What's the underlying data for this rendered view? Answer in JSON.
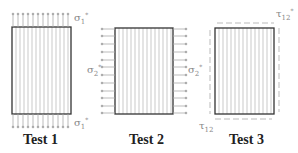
{
  "figure": {
    "tests": [
      {
        "label": "Test 1",
        "load": "σ1*",
        "load_symbol": "σ",
        "load_sub": "1",
        "load_sup": "*",
        "direction": "longitudinal tension (top & bottom edges)"
      },
      {
        "label": "Test 2",
        "load": "σ2*",
        "load_symbol": "σ",
        "load_sub": "2",
        "load_sup": "*",
        "direction": "transverse tension (left & right edges)"
      },
      {
        "label": "Test 3",
        "load": "τ12*",
        "load_symbol": "τ",
        "load_sub": "12",
        "load_sup": "*",
        "direction": "in-plane shear (all edges)"
      }
    ],
    "colors": {
      "box_border": "#333333",
      "fiber_lines": "#bbbbbb",
      "arrows": "#999999",
      "caption": "#222222"
    }
  }
}
